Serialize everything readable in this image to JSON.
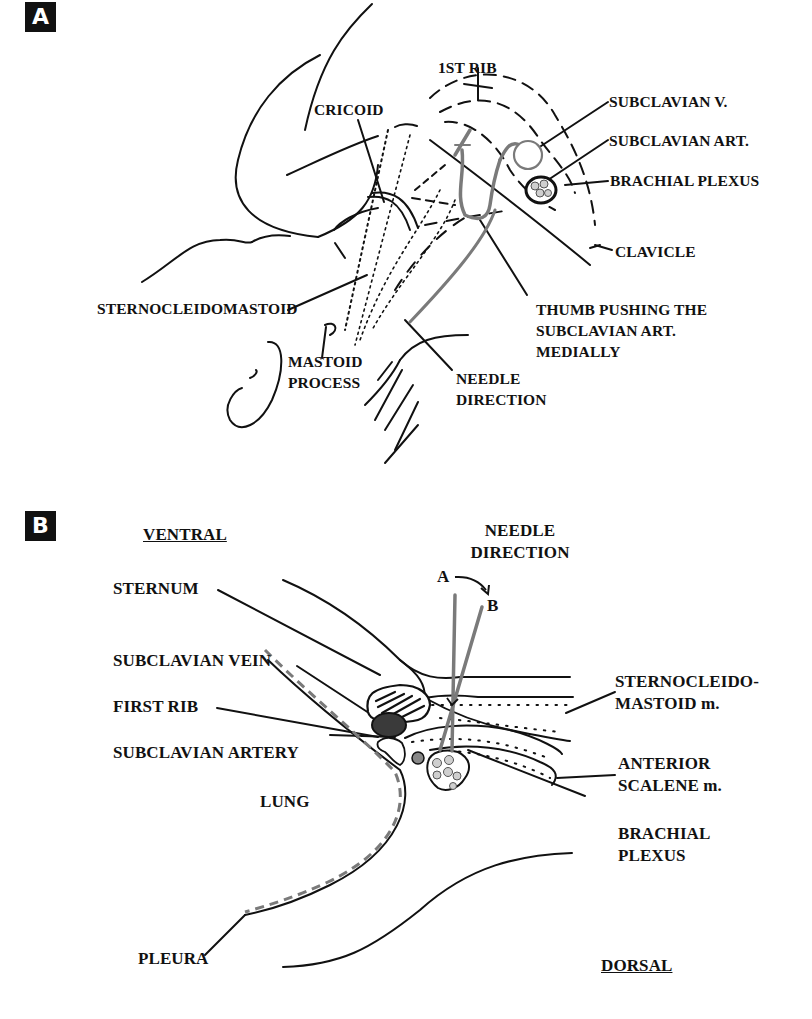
{
  "panel_a": {
    "badge": "A",
    "labels": {
      "first_rib": "1ST RIB",
      "cricoid": "CRICOID",
      "subclavian_v": "SUBCLAVIAN V.",
      "subclavian_art": "SUBCLAVIAN ART.",
      "brachial_plexus": "BRACHIAL PLEXUS",
      "clavicle": "CLAVICLE",
      "sternocleidomastoid": "STERNOCLEIDOMASTOID",
      "thumb_line1": "THUMB PUSHING THE",
      "thumb_line2": "SUBCLAVIAN ART.",
      "thumb_line3": "MEDIALLY",
      "mastoid_line1": "MASTOID",
      "mastoid_line2": "PROCESS",
      "needle_line1": "NEEDLE",
      "needle_line2": "DIRECTION"
    }
  },
  "panel_b": {
    "badge": "B",
    "labels": {
      "ventral": "VENTRAL",
      "dorsal": "DORSAL",
      "needle_line1": "NEEDLE",
      "needle_line2": "DIRECTION",
      "needle_a": "A",
      "needle_b": "B",
      "sternum": "STERNUM",
      "subclavian_vein": "SUBCLAVIAN VEIN",
      "first_rib": "FIRST RIB",
      "subclavian_artery": "SUBCLAVIAN ARTERY",
      "lung": "LUNG",
      "pleura": "PLEURA",
      "scm_line1": "STERNOCLEIDO-",
      "scm_line2": "MASTOID m.",
      "scalene_line1": "ANTERIOR",
      "scalene_line2": "SCALENE m.",
      "brachial_line1": "BRACHIAL",
      "brachial_line2": "PLEXUS"
    }
  },
  "colors": {
    "ink": "#111111",
    "needle_gray": "#7a7a7a",
    "vein_fill": "#3a3a3a",
    "artery_fill": "#888888",
    "nerve_fill": "#cfcfcf"
  }
}
